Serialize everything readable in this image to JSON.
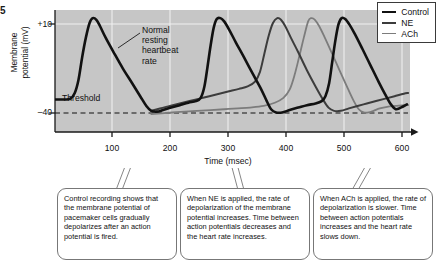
{
  "figure": {
    "label_fragment": "5"
  },
  "axes": {
    "y_label_line1": "Membrane",
    "y_label_line2": "potential (mV)",
    "y_ticks": [
      "+10",
      "–40"
    ],
    "x_label": "Time (msec)",
    "x_ticks": [
      "100",
      "200",
      "300",
      "400",
      "500",
      "600"
    ]
  },
  "annotations": {
    "normal_rate": "Normal\nresting\nheartbeat\nrate",
    "normal_rate_lines": [
      "Normal",
      "resting",
      "heartbeat",
      "rate"
    ],
    "threshold": "Threshold"
  },
  "legend": {
    "items": [
      {
        "label": "Control",
        "color": "#111111",
        "width": 2.6
      },
      {
        "label": "NE",
        "color": "#3c3c3c",
        "width": 2.0
      },
      {
        "label": "ACh",
        "color": "#7c7c7c",
        "width": 1.8
      }
    ]
  },
  "callouts": [
    {
      "id": "control-callout",
      "text": "Control recording shows that the membrane potential of pacemaker cells gradually depolarizes after an action potential is fired."
    },
    {
      "id": "ne-callout",
      "text": "When NE is applied, the rate of depolarization of the membrane potential increases. Time between action potentials decreases and the heart rate increases."
    },
    {
      "id": "ach-callout",
      "text": "When ACh is applied, the rate of depolarization is slower. Time between action potentials increases and the heart rate slows down."
    }
  ],
  "colors": {
    "plot_background": "#c6c6c6",
    "gridline": "#efefef",
    "axis": "#1a1a1a",
    "threshold_dash": "#111111",
    "callout_border": "#777777"
  },
  "chart_data": {
    "type": "line",
    "title": "",
    "xlabel": "Time (msec)",
    "ylabel": "Membrane potential (mV)",
    "xlim": [
      40,
      615
    ],
    "ylim": [
      -60,
      15
    ],
    "xticks": [
      100,
      200,
      300,
      400,
      500,
      600
    ],
    "yticks": [
      10,
      -40
    ],
    "grid": true,
    "grid_orientation": "both",
    "legend_position": "top-right",
    "threshold_value": -40,
    "threshold_style": "dashed",
    "series": [
      {
        "name": "Control",
        "color": "#111111",
        "width": 2.6,
        "peaks_msec": [
          100,
          290,
          490
        ],
        "peak_value": 10,
        "trough_value": -47,
        "points": [
          [
            40,
            -40
          ],
          [
            55,
            -40
          ],
          [
            65,
            -39.5
          ],
          [
            72,
            -36
          ],
          [
            78,
            -28
          ],
          [
            84,
            -14
          ],
          [
            90,
            -2
          ],
          [
            96,
            7
          ],
          [
            101,
            10
          ],
          [
            107,
            9
          ],
          [
            113,
            5
          ],
          [
            122,
            -2
          ],
          [
            135,
            -11
          ],
          [
            150,
            -21
          ],
          [
            165,
            -30
          ],
          [
            178,
            -38
          ],
          [
            188,
            -44
          ],
          [
            196,
            -47
          ],
          [
            205,
            -47.5
          ],
          [
            215,
            -46.5
          ],
          [
            228,
            -45
          ],
          [
            242,
            -43.5
          ],
          [
            256,
            -42
          ],
          [
            268,
            -41
          ],
          [
            276,
            -39
          ],
          [
            282,
            -32
          ],
          [
            287,
            -20
          ],
          [
            292,
            -7
          ],
          [
            297,
            4
          ],
          [
            302,
            9.5
          ],
          [
            308,
            10
          ],
          [
            314,
            8
          ],
          [
            322,
            3
          ],
          [
            333,
            -5
          ],
          [
            346,
            -14
          ],
          [
            360,
            -24
          ],
          [
            373,
            -33
          ],
          [
            383,
            -41
          ],
          [
            390,
            -46
          ],
          [
            398,
            -48
          ],
          [
            408,
            -48
          ],
          [
            420,
            -46.5
          ],
          [
            434,
            -45
          ],
          [
            448,
            -43.5
          ],
          [
            462,
            -42.5
          ],
          [
            472,
            -41
          ],
          [
            478,
            -38
          ],
          [
            484,
            -30
          ],
          [
            489,
            -17
          ],
          [
            494,
            -4
          ],
          [
            499,
            6
          ],
          [
            504,
            10
          ],
          [
            510,
            9.5
          ],
          [
            517,
            6
          ],
          [
            526,
            0
          ],
          [
            538,
            -9
          ],
          [
            551,
            -19
          ],
          [
            564,
            -29
          ],
          [
            575,
            -37
          ],
          [
            584,
            -43
          ],
          [
            592,
            -46
          ],
          [
            600,
            -45
          ],
          [
            610,
            -43
          ]
        ]
      },
      {
        "name": "NE",
        "color": "#3c3c3c",
        "width": 2.0,
        "peaks_msec": [
          400
        ],
        "peak_value": 10,
        "description": "Faster depolarization slope; reaches threshold sooner; shorter inter-spike interval",
        "points": [
          [
            196,
            -47
          ],
          [
            210,
            -45.5
          ],
          [
            226,
            -44
          ],
          [
            242,
            -42.5
          ],
          [
            258,
            -41
          ],
          [
            274,
            -39.5
          ],
          [
            290,
            -38
          ],
          [
            306,
            -36.5
          ],
          [
            322,
            -35
          ],
          [
            338,
            -33.5
          ],
          [
            352,
            -32
          ],
          [
            364,
            -29
          ],
          [
            372,
            -23
          ],
          [
            379,
            -12
          ],
          [
            386,
            -1
          ],
          [
            393,
            7
          ],
          [
            400,
            10
          ],
          [
            406,
            9
          ],
          [
            413,
            5
          ],
          [
            422,
            -2
          ],
          [
            434,
            -11
          ],
          [
            448,
            -22
          ],
          [
            462,
            -32
          ],
          [
            474,
            -40
          ],
          [
            483,
            -45
          ],
          [
            492,
            -47
          ],
          [
            503,
            -47
          ],
          [
            516,
            -45.5
          ],
          [
            530,
            -44
          ],
          [
            545,
            -42.5
          ],
          [
            560,
            -41
          ],
          [
            575,
            -39.5
          ],
          [
            590,
            -38
          ],
          [
            605,
            -36.5
          ],
          [
            612,
            -36
          ]
        ]
      },
      {
        "name": "ACh",
        "color": "#7c7c7c",
        "width": 1.8,
        "peaks_msec": [
          450,
          545
        ],
        "peak_value": 10,
        "description": "Slower depolarization slope; hyperpolarized; longer inter-spike interval",
        "points": [
          [
            196,
            -49
          ],
          [
            212,
            -48.5
          ],
          [
            230,
            -48
          ],
          [
            250,
            -47.5
          ],
          [
            270,
            -47
          ],
          [
            292,
            -46.5
          ],
          [
            314,
            -46
          ],
          [
            336,
            -45.5
          ],
          [
            356,
            -45
          ],
          [
            378,
            -44
          ],
          [
            396,
            -42
          ],
          [
            410,
            -39
          ],
          [
            420,
            -34
          ],
          [
            428,
            -25
          ],
          [
            436,
            -13
          ],
          [
            443,
            -2
          ],
          [
            450,
            8
          ],
          [
            455,
            10
          ],
          [
            461,
            9
          ],
          [
            468,
            5
          ],
          [
            477,
            -2
          ],
          [
            489,
            -12
          ],
          [
            502,
            -23
          ],
          [
            514,
            -33
          ],
          [
            524,
            -41
          ],
          [
            532,
            -46
          ],
          [
            540,
            -48
          ],
          [
            548,
            -48
          ],
          [
            556,
            -47
          ],
          [
            566,
            -45.5
          ],
          [
            578,
            -44.5
          ],
          [
            592,
            -44
          ],
          [
            606,
            -43.5
          ],
          [
            612,
            -43.5
          ]
        ]
      }
    ]
  }
}
